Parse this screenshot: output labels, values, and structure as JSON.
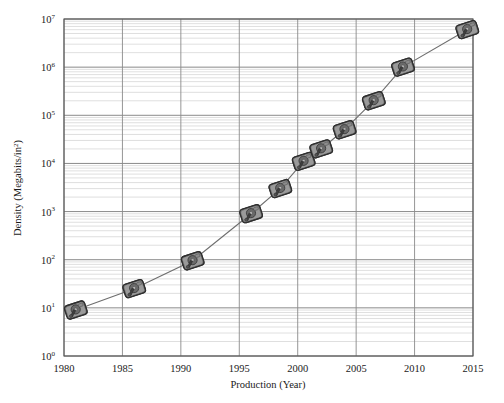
{
  "chart_data": {
    "type": "scatter",
    "title": "",
    "xlabel": "Production (Year)",
    "ylabel": "Density (Megabits/in²)",
    "ylabel_base": "Density (Megabits/in",
    "ylabel_sup": "2",
    "ylabel_tail": ")",
    "yscale": "log",
    "xscale": "linear",
    "xlim": [
      1980,
      2015
    ],
    "ylim": [
      1,
      10000000
    ],
    "grid": true,
    "minor_grid": true,
    "legend": "none",
    "marker_style": "hard-disk-drive-image",
    "line_style": "solid-thin-gray",
    "xticks": [
      1980,
      1985,
      1990,
      1995,
      2000,
      2005,
      2010,
      2015
    ],
    "xtick_labels": [
      "1980",
      "1985",
      "1990",
      "1995",
      "2000",
      "2005",
      "2010",
      "2015"
    ],
    "yticks": [
      1,
      10,
      100,
      1000,
      10000,
      100000,
      1000000,
      10000000
    ],
    "ytick_labels": [
      {
        "mantissa": "10",
        "exponent": "0"
      },
      {
        "mantissa": "10",
        "exponent": "1"
      },
      {
        "mantissa": "10",
        "exponent": "2"
      },
      {
        "mantissa": "10",
        "exponent": "3"
      },
      {
        "mantissa": "10",
        "exponent": "4"
      },
      {
        "mantissa": "10",
        "exponent": "5"
      },
      {
        "mantissa": "10",
        "exponent": "6"
      },
      {
        "mantissa": "10",
        "exponent": "7"
      }
    ],
    "x": [
      1981,
      1986,
      1991,
      1996,
      1998.5,
      2000.5,
      2002,
      2004,
      2006.5,
      2009,
      2014.5
    ],
    "y": [
      9,
      25,
      95,
      900,
      3000,
      11000,
      20000,
      50000,
      200000,
      1000000,
      6000000
    ],
    "points": [
      {
        "year": 1981,
        "density": 9
      },
      {
        "year": 1986,
        "density": 25
      },
      {
        "year": 1991,
        "density": 95
      },
      {
        "year": 1996,
        "density": 900
      },
      {
        "year": 1998.5,
        "density": 3000
      },
      {
        "year": 2000.5,
        "density": 11000
      },
      {
        "year": 2002,
        "density": 20000
      },
      {
        "year": 2004,
        "density": 50000
      },
      {
        "year": 2006.5,
        "density": 200000
      },
      {
        "year": 2009,
        "density": 1000000
      },
      {
        "year": 2014.5,
        "density": 6000000
      }
    ]
  },
  "colors": {
    "frame": "#555555",
    "major_grid": "#8a8a8a",
    "minor_grid": "#c9c9c9",
    "line": "#6e6e6e",
    "marker_body": "#7a7a7a",
    "marker_dark": "#3d3d3d",
    "text": "#1a1a1a",
    "background": "#ffffff"
  }
}
